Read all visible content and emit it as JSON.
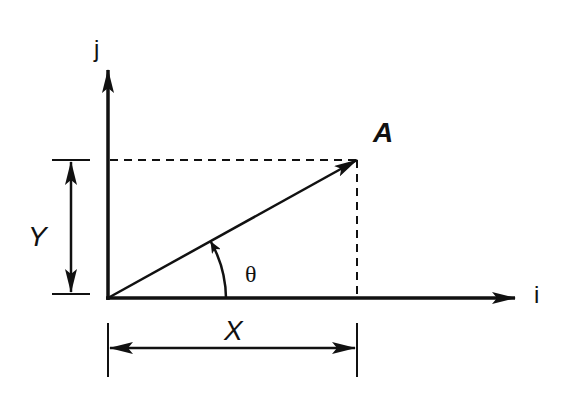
{
  "diagram": {
    "type": "vector-components",
    "labels": {
      "j_axis": "j",
      "i_axis": "i",
      "vector": "A",
      "angle": "θ",
      "y_component": "Y",
      "x_component": "X"
    },
    "colors": {
      "stroke": "#111111",
      "background": "#ffffff"
    },
    "geometry": {
      "origin": [
        108,
        298
      ],
      "vector_tip": [
        357,
        160
      ],
      "j_axis_top": [
        108,
        68
      ],
      "i_axis_end": [
        515,
        298
      ]
    }
  }
}
